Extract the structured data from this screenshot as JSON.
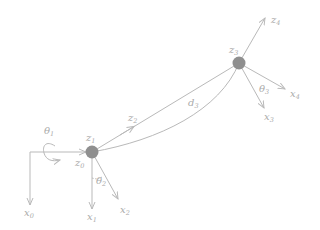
{
  "diagram": {
    "type": "robot-kinematic-frames",
    "colors": {
      "line": "#b9b9b9",
      "label": "#aaaaaa",
      "joint": "#8f8f8f",
      "background": "#ffffff"
    },
    "joints": [
      {
        "id": "joint-1",
        "label_z": "z",
        "sub_z": "1",
        "label_z_in": "z",
        "sub_z_in": "0"
      },
      {
        "id": "joint-2",
        "label_z": "z",
        "sub_z": "3"
      }
    ],
    "labels": {
      "theta1": {
        "main": "θ",
        "sub": "1"
      },
      "theta2": {
        "main": "θ",
        "sub": "2"
      },
      "theta3": {
        "main": "θ",
        "sub": "3"
      },
      "x0": {
        "main": "x",
        "sub": "0"
      },
      "x1": {
        "main": "x",
        "sub": "1"
      },
      "x2": {
        "main": "x",
        "sub": "2"
      },
      "x3": {
        "main": "x",
        "sub": "3"
      },
      "x4": {
        "main": "x",
        "sub": "4"
      },
      "z0": {
        "main": "z",
        "sub": "0"
      },
      "z1": {
        "main": "z",
        "sub": "1"
      },
      "z2": {
        "main": "z",
        "sub": "2"
      },
      "z3": {
        "main": "z",
        "sub": "3"
      },
      "z4": {
        "main": "z",
        "sub": "4"
      },
      "d3": {
        "main": "d",
        "sub": "3"
      }
    }
  }
}
